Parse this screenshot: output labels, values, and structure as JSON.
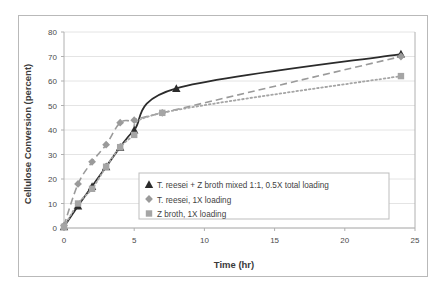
{
  "chart_data": {
    "type": "line",
    "title": "",
    "xlabel": "Time (hr)",
    "ylabel": "Cellulose Conversion (percent)",
    "xlim": [
      0,
      25
    ],
    "ylim": [
      0,
      80
    ],
    "xticks": [
      0,
      5,
      10,
      15,
      20,
      25
    ],
    "yticks": [
      0,
      10,
      20,
      30,
      40,
      50,
      60,
      70,
      80
    ],
    "grid": true,
    "grid_axis": "y",
    "legend_position": "inside-lower-center",
    "series": [
      {
        "name": "T. reesei + Z broth mixed 1:1, 0.5X total loading",
        "marker": "triangle",
        "color": "#2b2b2b",
        "linestyle": "solid",
        "x": [
          0,
          1,
          2,
          3,
          4,
          5,
          8,
          24
        ],
        "y": [
          0.5,
          9,
          17,
          25,
          33,
          40,
          57,
          71
        ]
      },
      {
        "name": "T. reesei, 1X loading",
        "marker": "diamond",
        "color": "#9a9a9a",
        "linestyle": "dashed",
        "x": [
          0,
          1,
          2,
          3,
          4,
          5,
          7,
          24
        ],
        "y": [
          1,
          18,
          27,
          34,
          43,
          44,
          47,
          70
        ]
      },
      {
        "name": "Z broth, 1X loading",
        "marker": "square",
        "color": "#a5a5a5",
        "linestyle": "dotted",
        "x": [
          0,
          1,
          2,
          3,
          4,
          5,
          7,
          24
        ],
        "y": [
          0.5,
          10,
          16,
          25,
          33,
          38,
          47,
          62
        ]
      }
    ],
    "legend": [
      {
        "marker": "triangle",
        "color": "#2b2b2b",
        "label": "T. reesei + Z broth mixed 1:1, 0.5X total loading"
      },
      {
        "marker": "diamond",
        "color": "#9a9a9a",
        "label": "T. reesei, 1X loading"
      },
      {
        "marker": "square",
        "color": "#a5a5a5",
        "label": "Z broth, 1X loading"
      }
    ],
    "colors": {
      "axis": "#b0b0b0",
      "grid": "#e4e4e4",
      "text": "#3b3b3b",
      "frame": "#b9b9b9"
    }
  }
}
